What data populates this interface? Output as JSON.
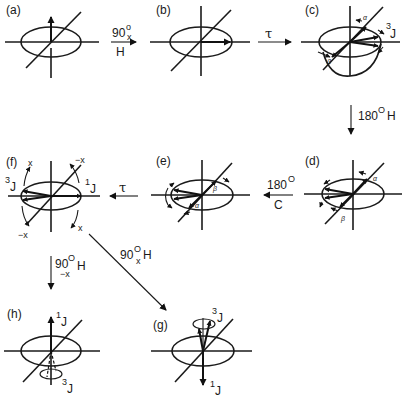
{
  "figure": {
    "panels": [
      {
        "id": "a",
        "label": "(a)"
      },
      {
        "id": "b",
        "label": "(b)"
      },
      {
        "id": "c",
        "label": "(c)",
        "annotations": {
          "alpha": "α",
          "beta": "β",
          "coupling": "3",
          "coupling_sub": "J"
        }
      },
      {
        "id": "d",
        "label": "(d)",
        "annotations": {
          "alpha": "α",
          "beta": "β"
        }
      },
      {
        "id": "e",
        "label": "(e)",
        "annotations": {
          "alpha": "α",
          "beta": "β"
        }
      },
      {
        "id": "f",
        "label": "(f)",
        "annotations": {
          "x_top": "x",
          "minus_x_top": "−x",
          "minus_x_bottom": "−x",
          "x_bottom": "x",
          "left_coupling": "3",
          "left_coupling_sub": "J",
          "right_coupling": "1",
          "right_coupling_sub": "J"
        }
      },
      {
        "id": "g",
        "label": "(g)",
        "annotations": {
          "top_coupling": "3",
          "top_coupling_sub": "J",
          "bottom_coupling": "1",
          "bottom_coupling_sub": "J"
        }
      },
      {
        "id": "h",
        "label": "(h)",
        "annotations": {
          "top_coupling": "1",
          "top_coupling_sub": "J",
          "bottom_coupling": "3",
          "bottom_coupling_sub": "J"
        }
      }
    ],
    "transitions": {
      "a_to_b": {
        "angle": "90",
        "degree": "o",
        "axis": "x",
        "nucleus": "H"
      },
      "b_to_c": {
        "symbol": "τ"
      },
      "c_to_d": {
        "angle": "180",
        "degree": "O",
        "nucleus": "H"
      },
      "d_to_e": {
        "angle": "180",
        "degree": "O",
        "nucleus": "C"
      },
      "e_to_f": {
        "symbol": "τ"
      },
      "f_to_h": {
        "angle": "90",
        "degree": "O",
        "axis": "−x",
        "nucleus": "H"
      },
      "f_to_g": {
        "angle": "90",
        "degree": "O",
        "axis": "x",
        "nucleus": "H"
      }
    }
  }
}
